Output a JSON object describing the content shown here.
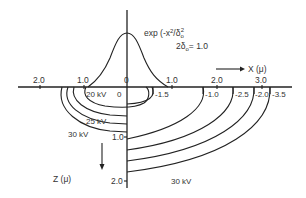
{
  "figure": {
    "formula": "exp (-x²/δ₀²",
    "formula_main": "exp (-x",
    "formula_sup1": "2",
    "formula_mid": "/δ",
    "formula_sub": "o",
    "formula_sup2": "2",
    "param": "2δ₀ = 1.0",
    "param_pre": "2δ",
    "param_sub": "o",
    "param_post": "= 1.0",
    "x_axis_label": "X (μ)",
    "z_axis_label": "Z (μ)",
    "x_ticks": [
      {
        "label": "2.0",
        "x": 40
      },
      {
        "label": "1.0",
        "x": 84
      },
      {
        "label": "0",
        "x": 127
      },
      {
        "label": "1.0",
        "x": 172
      },
      {
        "label": "2.0",
        "x": 217
      },
      {
        "label": "3.0",
        "x": 262
      }
    ],
    "z_ticks": [
      {
        "label": "1.0",
        "y": 137
      },
      {
        "label": "2.0",
        "y": 181
      }
    ],
    "contour_values": [
      {
        "label": "0"
      },
      {
        "label": "-1.5"
      },
      {
        "label": "-1.0"
      },
      {
        "label": "-2.5"
      },
      {
        "label": "-2.0"
      },
      {
        "label": "-3.5"
      }
    ],
    "voltage_labels": [
      {
        "label": "20 kV"
      },
      {
        "label": "25 kV"
      },
      {
        "label": "30 kV"
      },
      {
        "label": "30 kV"
      }
    ]
  }
}
